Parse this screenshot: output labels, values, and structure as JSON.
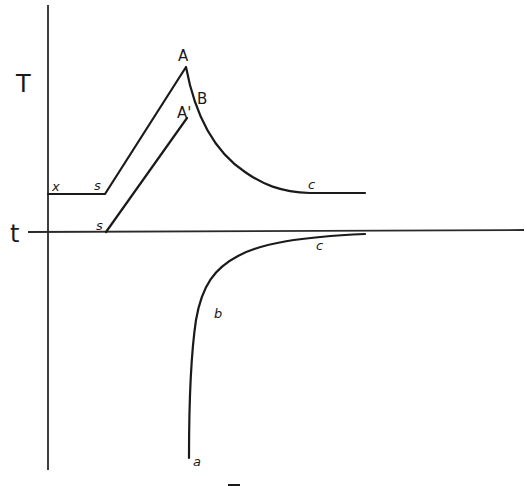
{
  "diagram": {
    "axes": {
      "vertical_label": "T",
      "horizontal_label": "t"
    },
    "upper_curve": {
      "labels": {
        "x": "x",
        "s": "s",
        "A": "A",
        "B": "B",
        "c": "c"
      }
    },
    "middle_line": {
      "labels": {
        "s": "s",
        "A_prime": "A'"
      }
    },
    "lower_curve": {
      "labels": {
        "a": "a",
        "b": "b",
        "c": "c"
      }
    },
    "bottom_mark": "—",
    "colors": {
      "ink": "#1a1a1a",
      "background": "#ffffff"
    }
  }
}
